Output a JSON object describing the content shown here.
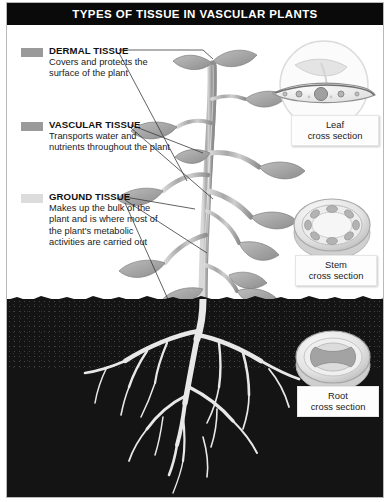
{
  "title": "TYPES OF TISSUE IN VASCULAR PLANTS",
  "legend": [
    {
      "name": "dermal",
      "title": "DERMAL TISSUE",
      "description": "Covers and protects the surface of the plant",
      "swatch": "#9a9a9a"
    },
    {
      "name": "vascular",
      "title": "VASCULAR TISSUE",
      "description": "Transports water and nutrients throughout the plant",
      "swatch": "#9a9a9a"
    },
    {
      "name": "ground",
      "title": "GROUND TISSUE",
      "description": "Makes up the bulk of the plant and is where most of the plant's metabolic activities are carried out",
      "swatch": "#dcdcdc"
    }
  ],
  "insets": [
    {
      "name": "leaf",
      "line1": "Leaf",
      "line2": "cross section"
    },
    {
      "name": "stem",
      "line1": "Stem",
      "line2": "cross section"
    },
    {
      "name": "root",
      "line1": "Root",
      "line2": "cross section"
    }
  ],
  "colors": {
    "title_bar": "#0a0a0a",
    "title_text": "#ffffff",
    "soil": "#141414",
    "plant": "#9e9e9e",
    "root": "#e8e8e8",
    "panel_border": "#b9b9b9"
  }
}
